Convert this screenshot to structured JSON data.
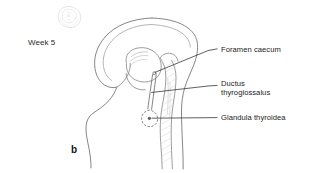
{
  "figure": {
    "panel_letter": "b",
    "stage_caption": "Week 5",
    "embryo_icon": "embryo-sketch-icon",
    "background_color": "#ffffff",
    "outline_color": "#6e6e6e",
    "leader_color": "#2b2b2b",
    "labels": [
      {
        "id": "foramen-caecum",
        "line1": "Foramen caecum",
        "line2": ""
      },
      {
        "id": "ductus-thyroglossalus",
        "line1": "Ductus",
        "line2": "thyroglossalus"
      },
      {
        "id": "glandula-thyroidea",
        "line1": "Glandula thyroidea",
        "line2": ""
      }
    ]
  }
}
